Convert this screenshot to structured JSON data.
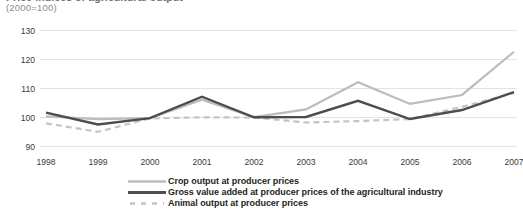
{
  "chart_data": {
    "type": "line",
    "title": "Price indices of agricultural output",
    "subtitle": "(2000=100)",
    "xlabel": "",
    "ylabel": "",
    "x": [
      1998,
      1999,
      2000,
      2001,
      2002,
      2003,
      2004,
      2005,
      2006,
      2007
    ],
    "categories": [
      "1998",
      "1999",
      "2000",
      "2001",
      "2002",
      "2003",
      "2004",
      "2005",
      "2006",
      "2007"
    ],
    "ylim": [
      85,
      133
    ],
    "xlim": [
      1997.5,
      2007.5
    ],
    "yticks": [
      90,
      100,
      110,
      120,
      130
    ],
    "ytick_labels": [
      "90",
      "100",
      "110",
      "120",
      "130"
    ],
    "grid": true,
    "grid_axis": "y",
    "legend_position": "bottom",
    "series": [
      {
        "name": "Crop output at producer prices",
        "key": "crop",
        "color": "#bcbcbc",
        "style": "solid",
        "width": 2.2,
        "values": [
          100.2,
          99.3,
          99.6,
          106.0,
          100.0,
          102.6,
          112.0,
          104.5,
          107.6,
          122.5
        ]
      },
      {
        "name": "Gross value added at producer prices of the agricultural industry",
        "key": "gva",
        "color": "#4d4d4d",
        "style": "solid",
        "width": 2.4,
        "values": [
          101.5,
          97.4,
          99.6,
          107.0,
          99.9,
          100.0,
          105.6,
          99.3,
          102.4,
          108.6
        ]
      },
      {
        "name": "Animal output at producer prices",
        "key": "animal",
        "color": "#c4c4c4",
        "style": "dashed",
        "width": 2.2,
        "values": [
          97.8,
          94.9,
          99.5,
          99.9,
          99.8,
          98.1,
          98.6,
          99.3,
          103.5,
          108.3
        ]
      }
    ]
  },
  "colors": {
    "background": "#ffffff",
    "gridline": "#e3e3e3",
    "tick_text": "#3b3b3b",
    "subtitle_text": "#8c8c8c",
    "legend_text": "#231f20"
  },
  "legend": {
    "items": [
      {
        "label": "Crop output at producer prices",
        "series_key": "crop"
      },
      {
        "label": "Gross value added at producer prices of the agricultural industry",
        "series_key": "gva"
      },
      {
        "label": "Animal output at producer prices",
        "series_key": "animal"
      }
    ]
  }
}
